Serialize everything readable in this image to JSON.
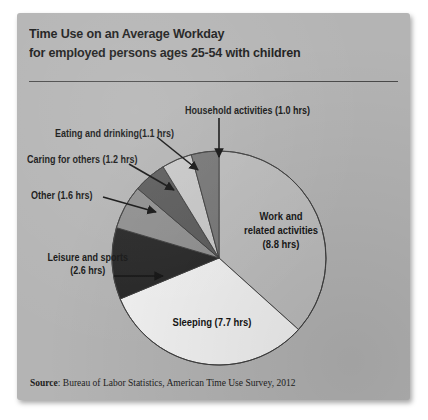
{
  "card": {
    "background_color": "#b4b4b4"
  },
  "header": {
    "title_line1": "Time Use on an Average Workday",
    "title_line2": "for employed persons ages 25-54 with children"
  },
  "source": {
    "label": "Source",
    "separator": ": ",
    "text": "Bureau of Labor Statistics, American Time Use Survey, 2012"
  },
  "labels": {
    "household": "Household activities (1.0 hrs)",
    "eating": "Eating and drinking(1.1 hrs)",
    "caring": "Caring for others (1.2 hrs)",
    "other": "Other (1.6 hrs)",
    "leisure_line1": "Leisure and sports",
    "leisure_line2": "(2.6 hrs)",
    "work_line1": "Work and",
    "work_line2": "related activities",
    "work_line3": "(8.8 hrs)",
    "sleeping": "Sleeping (7.7 hrs)"
  },
  "chart_data": {
    "type": "pie",
    "title": "Time Use on an Average Workday for employed persons ages 25-54 with children",
    "unit": "hours",
    "total": 24.0,
    "start_angle_deg": 0,
    "direction": "clockwise",
    "center": {
      "x": 202,
      "y": 245
    },
    "radius": 107,
    "stroke_color": "#3a3a3a",
    "categories": [
      "Work and related activities",
      "Sleeping",
      "Leisure and sports",
      "Other",
      "Caring for others",
      "Eating and drinking",
      "Household activities"
    ],
    "values": [
      8.8,
      7.7,
      2.6,
      1.6,
      1.2,
      1.1,
      1.0
    ],
    "colors": [
      "#bdbdbd",
      "#f2f2f2",
      "#262626",
      "#8f8f8f",
      "#5a5a5a",
      "#c9c9c9",
      "#767676"
    ],
    "slices": [
      {
        "label": "Work and related activities",
        "value": 8.8,
        "unit_label": "(8.8 hrs)",
        "color": "#bdbdbd",
        "percent": 36.7
      },
      {
        "label": "Sleeping",
        "value": 7.7,
        "unit_label": "(7.7 hrs)",
        "color": "#f2f2f2",
        "percent": 32.1
      },
      {
        "label": "Leisure and sports",
        "value": 2.6,
        "unit_label": "(2.6 hrs)",
        "color": "#262626",
        "percent": 10.8
      },
      {
        "label": "Other",
        "value": 1.6,
        "unit_label": "(1.6 hrs)",
        "color": "#8f8f8f",
        "percent": 6.7
      },
      {
        "label": "Caring for others",
        "value": 1.2,
        "unit_label": "(1.2 hrs)",
        "color": "#5a5a5a",
        "percent": 5.0
      },
      {
        "label": "Eating and drinking",
        "value": 1.1,
        "unit_label": "(1.1 hrs)",
        "color": "#c9c9c9",
        "percent": 4.6
      },
      {
        "label": "Household activities",
        "value": 1.0,
        "unit_label": "(1.0 hrs)",
        "color": "#767676",
        "percent": 4.2
      }
    ],
    "legend": "none",
    "grid": false
  }
}
